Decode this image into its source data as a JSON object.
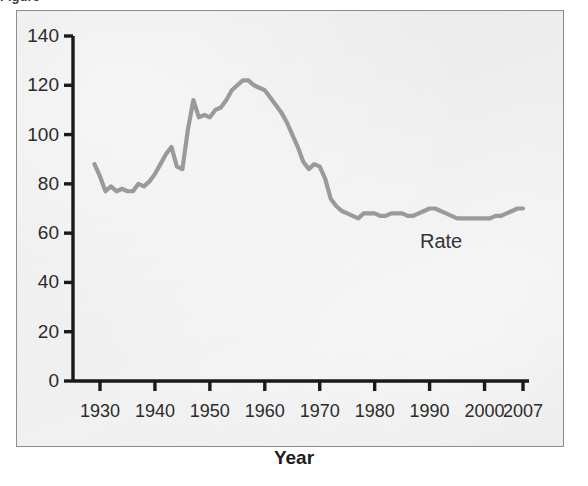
{
  "figure": {
    "clipped_top_text": "Figure",
    "series_label": "Rate",
    "axis_title_x": "Year",
    "line_color": "#9a9a9a",
    "axis_color": "#1a1a1a",
    "panel_fill": "#ececec",
    "panel_border": "#8d8d8d"
  },
  "axes": {
    "y_ticks": [
      "140",
      "120",
      "100",
      "80",
      "60",
      "40",
      "20",
      "0"
    ],
    "x_ticks": [
      "1930",
      "1940",
      "1950",
      "1960",
      "1970",
      "1980",
      "1990",
      "2000",
      "2007"
    ]
  },
  "chart_data": {
    "type": "line",
    "title": "",
    "xlabel": "Year",
    "ylabel": "",
    "xlim": [
      1929,
      2007
    ],
    "ylim": [
      0,
      140
    ],
    "grid": false,
    "legend": "inline-label",
    "series": [
      {
        "name": "Rate",
        "x": [
          1929,
          1930,
          1931,
          1932,
          1933,
          1934,
          1935,
          1936,
          1937,
          1938,
          1939,
          1940,
          1941,
          1942,
          1943,
          1944,
          1945,
          1946,
          1947,
          1948,
          1949,
          1950,
          1951,
          1952,
          1953,
          1954,
          1955,
          1956,
          1957,
          1958,
          1959,
          1960,
          1961,
          1962,
          1963,
          1964,
          1965,
          1966,
          1967,
          1968,
          1969,
          1970,
          1971,
          1972,
          1973,
          1974,
          1975,
          1976,
          1977,
          1978,
          1979,
          1980,
          1981,
          1982,
          1983,
          1984,
          1985,
          1986,
          1987,
          1988,
          1989,
          1990,
          1991,
          1992,
          1993,
          1994,
          1995,
          1996,
          1997,
          1998,
          1999,
          2000,
          2001,
          2002,
          2003,
          2004,
          2005,
          2006,
          2007
        ],
        "values": [
          88,
          83,
          77,
          79,
          77,
          78,
          77,
          77,
          80,
          79,
          81,
          84,
          88,
          92,
          95,
          87,
          86,
          102,
          114,
          107,
          108,
          107,
          110,
          111,
          114,
          118,
          120,
          122,
          122,
          120,
          119,
          118,
          115,
          112,
          109,
          105,
          100,
          95,
          89,
          86,
          88,
          87,
          82,
          74,
          71,
          69,
          68,
          67,
          66,
          68,
          68,
          68,
          67,
          67,
          68,
          68,
          68,
          67,
          67,
          68,
          69,
          70,
          70,
          69,
          68,
          67,
          66,
          66,
          66,
          66,
          66,
          66,
          66,
          67,
          67,
          68,
          69,
          70,
          70
        ]
      }
    ]
  }
}
